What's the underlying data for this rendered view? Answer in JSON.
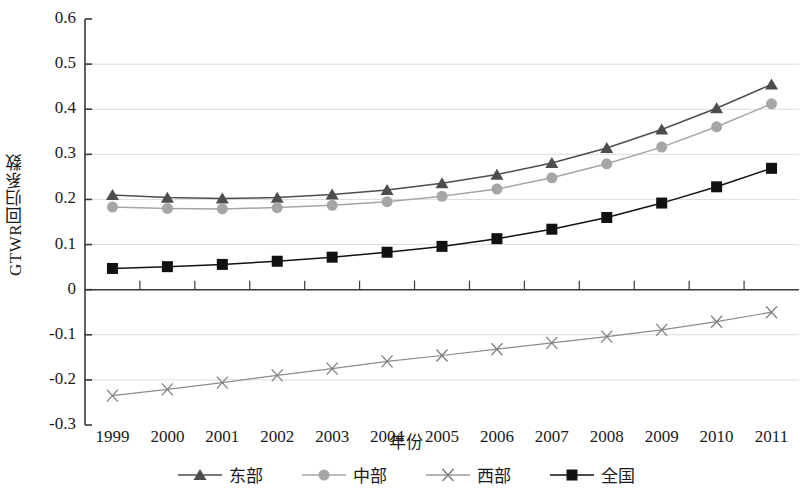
{
  "chart_data": {
    "type": "line",
    "title": "",
    "xlabel": "年份",
    "ylabel": "GTWR回归系数",
    "x": [
      1999,
      2000,
      2001,
      2002,
      2003,
      2004,
      2005,
      2006,
      2007,
      2008,
      2009,
      2010,
      2011
    ],
    "categories": [
      "1999",
      "2000",
      "2001",
      "2002",
      "2003",
      "2004",
      "2005",
      "2006",
      "2007",
      "2008",
      "2009",
      "2010",
      "2011"
    ],
    "xlim": [
      1999,
      2011
    ],
    "ylim": [
      -0.3,
      0.6
    ],
    "yticks": [
      -0.3,
      -0.2,
      -0.1,
      0,
      0.1,
      0.2,
      0.3,
      0.4,
      0.5,
      0.6
    ],
    "ytick_labels": [
      "-0.3",
      "-0.2",
      "-0.1",
      "0",
      "0.1",
      "0.2",
      "0.3",
      "0.4",
      "0.5",
      "0.6"
    ],
    "grid": true,
    "legend_position": "bottom",
    "series": [
      {
        "name": "东部",
        "marker": "triangle",
        "color": "#4d4d4d",
        "values": [
          0.21,
          0.204,
          0.202,
          0.204,
          0.211,
          0.221,
          0.236,
          0.255,
          0.281,
          0.314,
          0.355,
          0.402,
          0.455
        ]
      },
      {
        "name": "中部",
        "marker": "circle",
        "color": "#a6a6a6",
        "values": [
          0.183,
          0.18,
          0.179,
          0.182,
          0.187,
          0.195,
          0.207,
          0.223,
          0.248,
          0.279,
          0.316,
          0.361,
          0.412
        ]
      },
      {
        "name": "西部",
        "marker": "cross",
        "color": "#8c8c8c",
        "values": [
          -0.235,
          -0.221,
          -0.206,
          -0.19,
          -0.175,
          -0.159,
          -0.146,
          -0.132,
          -0.118,
          -0.104,
          -0.089,
          -0.071,
          -0.05
        ]
      },
      {
        "name": "全国",
        "marker": "square",
        "color": "#111111",
        "values": [
          0.047,
          0.051,
          0.056,
          0.063,
          0.072,
          0.083,
          0.096,
          0.113,
          0.134,
          0.16,
          0.192,
          0.228,
          0.269
        ]
      }
    ]
  },
  "legend": {
    "items": [
      {
        "label": "东部",
        "marker": "triangle-marker-icon"
      },
      {
        "label": "中部",
        "marker": "circle-marker-icon"
      },
      {
        "label": "西部",
        "marker": "cross-marker-icon"
      },
      {
        "label": "全国",
        "marker": "square-marker-icon"
      }
    ]
  },
  "axes": {
    "y_title": "GTWR回归系数",
    "x_title": "年份"
  },
  "colors": {
    "east": "#4d4d4d",
    "central": "#a6a6a6",
    "west": "#8c8c8c",
    "national": "#111111",
    "axis": "#3a3a3a",
    "grid": "#dcdcdc"
  }
}
